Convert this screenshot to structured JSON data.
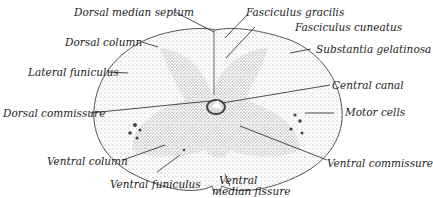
{
  "diagram": {
    "labels": {
      "dorsal_median_septum": "Dorsal median septum",
      "fasciculus_gracilis": "Fasciculus gracilis",
      "dorsal_column": "Dorsal column",
      "fasciculus_cuneatus": "Fasciculus cuneatus",
      "substantia_gelatinosa": "Substantia gelatinosa",
      "lateral_funiculus": "Lateral funiculus",
      "central_canal": "Central canal",
      "dorsal_commissure": "Dorsal commissure",
      "motor_cells": "Motor cells",
      "ventral_column": "Ventral column",
      "ventral_commissure": "Ventral commissure",
      "ventral_funiculus": "Ventral funiculus",
      "ventral_median_fissure_1": "Ventral",
      "ventral_median_fissure_2": "median fissure"
    },
    "colors": {
      "ink": "#222222",
      "stipple": "#8a8a8a",
      "background": "#ffffff"
    }
  }
}
